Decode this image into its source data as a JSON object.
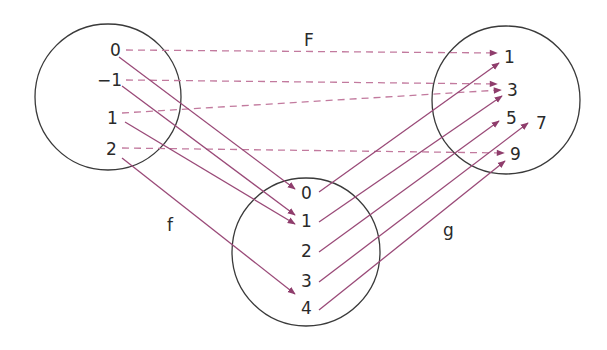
{
  "diagram": {
    "type": "function-mapping",
    "colors": {
      "circle_stroke": "#3a3a3a",
      "solid_arrow": "#9a4a78",
      "dashed_arrow": "#c27a9e",
      "text": "#2a2a2a"
    },
    "sets": {
      "domain": {
        "name": "left-set",
        "elements": [
          {
            "label": "0",
            "x": 116,
            "y": 56
          },
          {
            "label": "−1",
            "x": 108,
            "y": 86
          },
          {
            "label": "1",
            "x": 112,
            "y": 124
          },
          {
            "label": "2",
            "x": 112,
            "y": 155
          }
        ]
      },
      "intermediate": {
        "name": "bottom-set",
        "elements": [
          {
            "label": "0",
            "x": 306,
            "y": 199
          },
          {
            "label": "1",
            "x": 306,
            "y": 227
          },
          {
            "label": "2",
            "x": 306,
            "y": 257
          },
          {
            "label": "3",
            "x": 306,
            "y": 287
          },
          {
            "label": "4",
            "x": 306,
            "y": 314
          }
        ]
      },
      "codomain": {
        "name": "right-set",
        "elements": [
          {
            "label": "1",
            "x": 509,
            "y": 63
          },
          {
            "label": "3",
            "x": 512,
            "y": 96
          },
          {
            "label": "5",
            "x": 511,
            "y": 124
          },
          {
            "label": "7",
            "x": 541,
            "y": 129
          },
          {
            "label": "9",
            "x": 515,
            "y": 160
          }
        ]
      }
    },
    "function_labels": {
      "F": {
        "text": "F",
        "x": 308,
        "y": 46
      },
      "f": {
        "text": "f",
        "x": 170,
        "y": 231
      },
      "g": {
        "text": "g",
        "x": 447,
        "y": 236
      }
    },
    "mappings": {
      "f": [
        {
          "from": "0",
          "to": "0"
        },
        {
          "from": "−1",
          "to": "1"
        },
        {
          "from": "1",
          "to": "1"
        },
        {
          "from": "2",
          "to": "4"
        }
      ],
      "g": [
        {
          "from": "0",
          "to": "1"
        },
        {
          "from": "1",
          "to": "3"
        },
        {
          "from": "2",
          "to": "5"
        },
        {
          "from": "3",
          "to": "7"
        },
        {
          "from": "4",
          "to": "9"
        }
      ],
      "F": [
        {
          "from": "0",
          "to": "1"
        },
        {
          "from": "−1",
          "to": "3"
        },
        {
          "from": "1",
          "to": "3"
        },
        {
          "from": "2",
          "to": "9"
        }
      ]
    }
  }
}
